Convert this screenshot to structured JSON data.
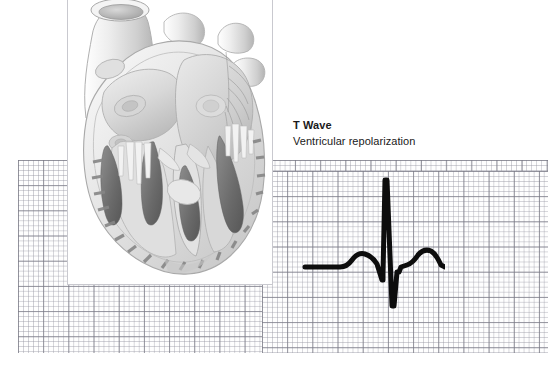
{
  "page": {
    "background_color": "#ffffff",
    "width": 556,
    "height": 370
  },
  "annotation": {
    "title": "T Wave",
    "subtitle": "Ventricular repolarization",
    "title_color": "#1a1a1a",
    "subtitle_color": "#1a1a1a"
  },
  "ecg_paper": {
    "name": "ecg-graph-paper",
    "minor_line_color": "#9696a2",
    "major_line_color": "#787884",
    "paper_color": "#fefefe",
    "minor_spacing_px": 5,
    "major_spacing_px": 25
  },
  "ecg_trace": {
    "name": "ecg-waveform",
    "stroke_color": "#0d0d0d",
    "baseline_color": "#0d0d0d",
    "segments": [
      {
        "label": "baseline-left",
        "description": "isoelectric line"
      },
      {
        "label": "p-wave",
        "description": "atrial depolarization bump"
      },
      {
        "label": "pr-segment",
        "description": "flat segment"
      },
      {
        "label": "qrs-complex",
        "description": "sharp R spike up then S dip down"
      },
      {
        "label": "st-segment",
        "description": "short flat segment"
      },
      {
        "label": "t-wave",
        "description": "ventricular repolarization bump"
      }
    ],
    "path": "M 10 99 L 45 99 Q 52 99 57 92 Q 63 84 70 86 Q 77 88 82 96 L 87 112 L 88 112 L 88 106 L 90 12 L 92 12 L 97 138 L 99 138 L 102 104 L 104 104 L 106 99 L 112 97 Q 118 95 123 87 Q 129 80 136 83 Q 141 86 146 97 L 150 99"
  },
  "heart_illustration": {
    "name": "heart-anatomy-cross-section",
    "panel_background": "#ffffff",
    "panel_border_color": "#c9c9cf",
    "description": "Grayscale anatomical cross-section of the human heart showing great vessels, atria, ventricles, valves, papillary muscles and trabeculae carneae",
    "base_tone": "#e8e8e8",
    "mid_tone": "#cfcfcf",
    "dark_tone": "#7f7f7f",
    "muscle_tone": "#6e6e6e"
  }
}
